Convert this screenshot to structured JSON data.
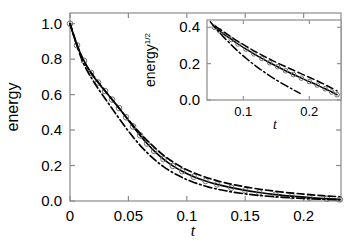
{
  "figure": {
    "background": "#ffffff",
    "ink": "#000000"
  },
  "chart_data": {
    "type": "line",
    "title": "",
    "xlabel": "t",
    "ylabel": "energy",
    "xlim": [
      0,
      0.232
    ],
    "ylim": [
      0.0,
      1.06
    ],
    "grid": false,
    "legend": "none",
    "xticks": [
      0,
      0.05,
      0.1,
      0.15,
      0.2
    ],
    "xticklabels": [
      "0",
      "0.05",
      "0.1",
      "0.15",
      "0.2"
    ],
    "yticks": [
      0.0,
      0.2,
      0.4,
      0.6,
      0.8,
      1.0
    ],
    "yticklabels": [
      "0.0",
      "0.2",
      "0.4",
      "0.6",
      "0.8",
      "1.0"
    ],
    "series": [
      {
        "name": "simulation-data",
        "style": "solid-with-open-circles",
        "marker": "circle-open",
        "x": [
          0.0,
          0.006,
          0.012,
          0.018,
          0.024,
          0.03,
          0.036,
          0.042,
          0.048,
          0.054,
          0.06,
          0.066,
          0.072,
          0.08,
          0.088,
          0.096,
          0.106,
          0.116,
          0.126,
          0.138,
          0.15,
          0.162,
          0.176,
          0.19,
          0.205,
          0.22,
          0.231
        ],
        "y": [
          1.0,
          0.878,
          0.79,
          0.722,
          0.668,
          0.62,
          0.572,
          0.524,
          0.472,
          0.42,
          0.37,
          0.324,
          0.283,
          0.236,
          0.198,
          0.168,
          0.137,
          0.113,
          0.094,
          0.075,
          0.06,
          0.048,
          0.036,
          0.027,
          0.019,
          0.013,
          0.009
        ]
      },
      {
        "name": "dashed-model",
        "style": "dashed",
        "marker": "none",
        "x": [
          0.0,
          0.01,
          0.02,
          0.03,
          0.04,
          0.05,
          0.06,
          0.07,
          0.08,
          0.092,
          0.104,
          0.118,
          0.132,
          0.148,
          0.164,
          0.182,
          0.2,
          0.216,
          0.231
        ],
        "y": [
          1.0,
          0.812,
          0.706,
          0.622,
          0.54,
          0.458,
          0.382,
          0.316,
          0.258,
          0.204,
          0.164,
          0.13,
          0.104,
          0.082,
          0.065,
          0.05,
          0.039,
          0.03,
          0.024
        ]
      },
      {
        "name": "dash-dot-model",
        "style": "dash-dot",
        "marker": "none",
        "x": [
          0.0,
          0.01,
          0.02,
          0.03,
          0.04,
          0.05,
          0.06,
          0.07,
          0.08,
          0.092,
          0.104,
          0.118,
          0.132,
          0.148,
          0.164,
          0.182,
          0.2,
          0.216,
          0.231
        ],
        "y": [
          1.0,
          0.8,
          0.676,
          0.578,
          0.484,
          0.394,
          0.314,
          0.248,
          0.194,
          0.146,
          0.11,
          0.08,
          0.059,
          0.042,
          0.03,
          0.021,
          0.014,
          0.01,
          0.007
        ]
      }
    ],
    "inset": {
      "type": "line",
      "title": "",
      "xlabel": "t",
      "ylabel": "energy",
      "ylabel_superscript": "1/2",
      "xlim": [
        0.045,
        0.248
      ],
      "ylim": [
        0.0,
        0.44
      ],
      "grid": false,
      "legend": "none",
      "xticks": [
        0.1,
        0.2
      ],
      "xticklabels": [
        "0.1",
        "0.2"
      ],
      "yticks": [
        0.0,
        0.2,
        0.4
      ],
      "yticklabels": [
        "0.0",
        "0.2",
        "0.4"
      ],
      "series": [
        {
          "name": "simulation-data-sqrt",
          "style": "solid-with-open-circles",
          "marker": "circle-open",
          "x": [
            0.056,
            0.064,
            0.072,
            0.082,
            0.092,
            0.104,
            0.116,
            0.128,
            0.14,
            0.152,
            0.164,
            0.176,
            0.188,
            0.2,
            0.212,
            0.224,
            0.234,
            0.242
          ],
          "y": [
            0.4,
            0.381,
            0.358,
            0.333,
            0.308,
            0.28,
            0.254,
            0.229,
            0.205,
            0.183,
            0.161,
            0.14,
            0.12,
            0.101,
            0.082,
            0.062,
            0.044,
            0.029
          ]
        },
        {
          "name": "dashed-model-sqrt",
          "style": "dashed",
          "marker": "none",
          "x": [
            0.058,
            0.068,
            0.08,
            0.092,
            0.106,
            0.12,
            0.134,
            0.15,
            0.166,
            0.182,
            0.198,
            0.214,
            0.23,
            0.242
          ],
          "y": [
            0.405,
            0.38,
            0.351,
            0.322,
            0.292,
            0.263,
            0.236,
            0.207,
            0.18,
            0.154,
            0.128,
            0.102,
            0.073,
            0.05
          ]
        },
        {
          "name": "dash-dot-model-sqrt",
          "style": "dash-dot",
          "marker": "none",
          "x": [
            0.05,
            0.058,
            0.068,
            0.08,
            0.092,
            0.106,
            0.12,
            0.134,
            0.15,
            0.164,
            0.176,
            0.186
          ],
          "y": [
            0.43,
            0.396,
            0.355,
            0.31,
            0.268,
            0.224,
            0.184,
            0.148,
            0.11,
            0.08,
            0.056,
            0.036
          ]
        }
      ]
    }
  }
}
